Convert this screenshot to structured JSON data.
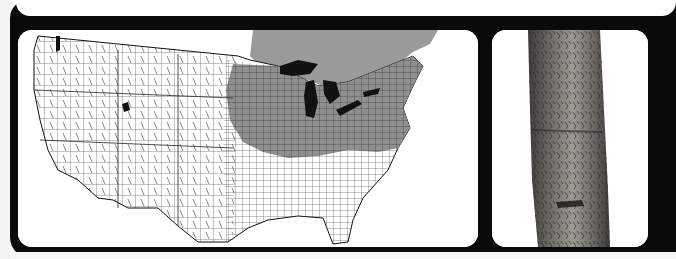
{
  "page": {
    "type": "field-guide-plate",
    "panels": [
      {
        "name": "range-map",
        "description": "County-level range map of the United States with eastern range shaded"
      },
      {
        "name": "bark-photo",
        "description": "Photograph of tree trunk bark"
      }
    ]
  },
  "colors": {
    "panel_background": "#0a0a0a",
    "card_background": "#ffffff",
    "range_shade": "#8f8f8f",
    "canada_shade": "#9a9a9a",
    "water": "#111111",
    "county_lines": "#222222",
    "bark_dark": "#3c3a37",
    "bark_mid": "#6d6a65",
    "bark_light": "#9d9a94"
  },
  "map": {
    "region": "United States",
    "shaded_range": "Eastern US and southern Canada",
    "features": [
      "Great Lakes",
      "county boundaries",
      "state boundaries",
      "Gulf of Mexico coast",
      "Atlantic coast"
    ]
  }
}
